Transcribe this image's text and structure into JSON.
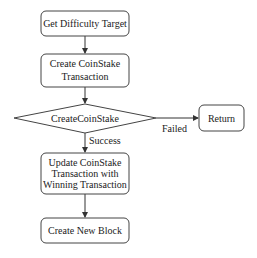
{
  "diagram": {
    "type": "flowchart",
    "colors": {
      "stroke": "#444444",
      "text": "#222222",
      "background": "#ffffff"
    },
    "nodes": [
      {
        "id": "get-difficulty-target",
        "shape": "rounded-rect",
        "lines": [
          "Get Difficulty Target"
        ]
      },
      {
        "id": "create-coinstake-transaction",
        "shape": "rounded-rect",
        "lines": [
          "Create CoinStake",
          "Transaction"
        ]
      },
      {
        "id": "createcoinstake-decision",
        "shape": "diamond",
        "lines": [
          "CreateCoinStake"
        ]
      },
      {
        "id": "return",
        "shape": "rounded-rect",
        "lines": [
          "Return"
        ]
      },
      {
        "id": "update-coinstake-transaction",
        "shape": "rounded-rect",
        "lines": [
          "Update CoinStake",
          "Transaction with",
          "Winning Transaction"
        ]
      },
      {
        "id": "create-new-block",
        "shape": "rounded-rect",
        "lines": [
          "Create New Block"
        ]
      }
    ],
    "edges": [
      {
        "from": "get-difficulty-target",
        "to": "create-coinstake-transaction",
        "label": ""
      },
      {
        "from": "create-coinstake-transaction",
        "to": "createcoinstake-decision",
        "label": ""
      },
      {
        "from": "createcoinstake-decision",
        "to": "return",
        "label": "Failed"
      },
      {
        "from": "createcoinstake-decision",
        "to": "update-coinstake-transaction",
        "label": "Success"
      },
      {
        "from": "update-coinstake-transaction",
        "to": "create-new-block",
        "label": ""
      }
    ]
  }
}
